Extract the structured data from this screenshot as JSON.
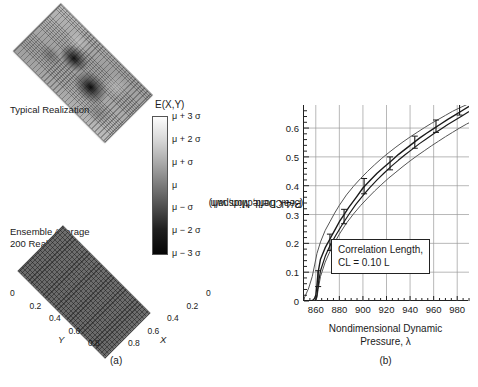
{
  "panel_a": {
    "caption": "(a)",
    "typical_label": "Typical Realization",
    "ensemble_label_line1": "Ensemble Average",
    "ensemble_label_line2": "200 Realizations",
    "colorbar_title": "E(X,Y)",
    "colorbar_ticks": [
      "μ + 3 σ",
      "μ + 2 σ",
      "μ +  σ",
      "μ",
      "μ −  σ",
      "μ − 2 σ",
      "μ − 3 σ"
    ],
    "colorbar_top_color": "#fdfdfd",
    "colorbar_bottom_color": "#050505",
    "axis_x_name": "X",
    "axis_y_name": "Y",
    "axis_ticks": [
      "0",
      "0.2",
      "0.4",
      "0.6",
      "0.8"
    ]
  },
  "panel_b": {
    "caption": "(b)",
    "annotation_line1": "Correlation Length,",
    "annotation_line2": "CL = 0.10 L"
  },
  "chart_data": {
    "type": "line",
    "title": "",
    "xlabel": "Nondimensional Dynamic Pressure, λ",
    "xlabel_line1": "Nondimensional Dynamic",
    "xlabel_line2": "Pressure, λ",
    "ylabel": "Peak Deflection, w/h (3/4-Chord, Midspan)",
    "ylabel_line1": "Peak Deflection, w/h",
    "ylabel_line2": "(3/4-Chord, Midspan)",
    "xlim": [
      850,
      990
    ],
    "ylim": [
      0,
      0.68
    ],
    "xticks": [
      860,
      880,
      900,
      920,
      940,
      960,
      980
    ],
    "yticks": [
      0,
      0.1,
      0.2,
      0.3,
      0.4,
      0.5,
      0.6
    ],
    "xtick_labels": [
      "860",
      "880",
      "900",
      "920",
      "940",
      "960",
      "980"
    ],
    "ytick_labels": [
      "0",
      "0.1",
      "0.2",
      "0.3",
      "0.4",
      "0.5",
      "0.6"
    ],
    "xminor_step": 5,
    "grid": true,
    "legend": "none",
    "series": [
      {
        "name": "mean",
        "color": "#1a1a1a",
        "width": 1.4,
        "x": [
          850,
          856,
          858,
          859,
          860,
          861,
          862,
          864,
          868,
          872,
          876,
          880,
          884,
          888,
          894,
          900,
          906,
          912,
          918,
          924,
          930,
          936,
          942,
          948,
          954,
          960,
          966,
          972,
          978,
          984,
          990
        ],
        "y": [
          0.0,
          0.0,
          0.004,
          0.01,
          0.02,
          0.055,
          0.1,
          0.145,
          0.185,
          0.215,
          0.245,
          0.275,
          0.3,
          0.325,
          0.358,
          0.392,
          0.418,
          0.443,
          0.465,
          0.486,
          0.508,
          0.527,
          0.546,
          0.565,
          0.582,
          0.598,
          0.614,
          0.63,
          0.645,
          0.66,
          0.675
        ]
      },
      {
        "name": "upper-bound",
        "color": "#555555",
        "width": 1.0,
        "x": [
          850,
          854,
          857,
          859,
          861,
          864,
          868,
          872,
          876,
          880,
          886,
          892,
          898,
          904,
          910,
          916,
          922,
          928,
          934,
          940,
          946,
          952,
          958,
          964,
          970,
          976,
          982,
          988,
          990
        ],
        "y": [
          0.008,
          0.045,
          0.085,
          0.125,
          0.165,
          0.205,
          0.245,
          0.275,
          0.305,
          0.332,
          0.368,
          0.398,
          0.425,
          0.45,
          0.473,
          0.495,
          0.515,
          0.534,
          0.552,
          0.569,
          0.585,
          0.601,
          0.616,
          0.63,
          0.644,
          0.658,
          0.67,
          0.681,
          0.683
        ]
      },
      {
        "name": "lower-bound",
        "color": "#555555",
        "width": 1.0,
        "x": [
          858,
          860,
          861,
          862,
          864,
          868,
          872,
          876,
          880,
          886,
          892,
          898,
          904,
          910,
          916,
          922,
          928,
          934,
          940,
          946,
          952,
          958,
          964,
          970,
          976,
          982,
          988,
          990
        ],
        "y": [
          0.0,
          0.002,
          0.012,
          0.04,
          0.085,
          0.135,
          0.172,
          0.203,
          0.232,
          0.27,
          0.302,
          0.331,
          0.357,
          0.382,
          0.405,
          0.427,
          0.447,
          0.467,
          0.486,
          0.504,
          0.521,
          0.538,
          0.554,
          0.57,
          0.585,
          0.6,
          0.614,
          0.618
        ]
      },
      {
        "name": "secondary-mean",
        "color": "#1a1a1a",
        "width": 1.2,
        "x": [
          859,
          860,
          861,
          862,
          864,
          868,
          872,
          877,
          882,
          888,
          894,
          900,
          906,
          912,
          918,
          924,
          930,
          936,
          942,
          948,
          954,
          960,
          966,
          972,
          978,
          984,
          990
        ],
        "y": [
          0.0,
          0.005,
          0.02,
          0.055,
          0.105,
          0.155,
          0.192,
          0.228,
          0.262,
          0.3,
          0.335,
          0.366,
          0.394,
          0.42,
          0.444,
          0.467,
          0.488,
          0.508,
          0.527,
          0.546,
          0.563,
          0.58,
          0.596,
          0.612,
          0.627,
          0.642,
          0.657
        ]
      }
    ],
    "error_bars": {
      "color": "#1a1a1a",
      "points": [
        {
          "x": 862,
          "ylow": 0.05,
          "yhigh": 0.105
        },
        {
          "x": 872,
          "ylow": 0.175,
          "yhigh": 0.232
        },
        {
          "x": 884,
          "ylow": 0.268,
          "yhigh": 0.318
        },
        {
          "x": 901,
          "ylow": 0.372,
          "yhigh": 0.425
        },
        {
          "x": 923,
          "ylow": 0.455,
          "yhigh": 0.5
        },
        {
          "x": 944,
          "ylow": 0.53,
          "yhigh": 0.572
        },
        {
          "x": 962,
          "ylow": 0.585,
          "yhigh": 0.628
        },
        {
          "x": 982,
          "ylow": 0.645,
          "yhigh": 0.683
        }
      ]
    }
  }
}
